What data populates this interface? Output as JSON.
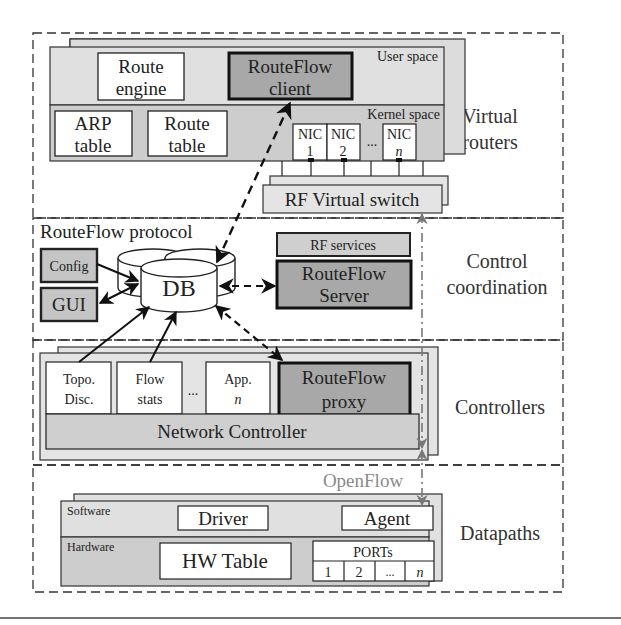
{
  "layers": [
    {
      "id": "virtual-routers",
      "label_line1": "Virtual",
      "label_line2": "routers"
    },
    {
      "id": "control-coordination",
      "label_line1": "Control",
      "label_line2": "coordination"
    },
    {
      "id": "controllers",
      "label": "Controllers"
    },
    {
      "id": "datapaths",
      "label": "Datapaths"
    }
  ],
  "virtual_router": {
    "user_space_label": "User space",
    "kernel_space_label": "Kernel space",
    "route_engine": {
      "line1": "Route",
      "line2": "engine"
    },
    "routeflow_client": {
      "line1": "RouteFlow",
      "line2": "client"
    },
    "arp_table": {
      "line1": "ARP",
      "line2": "table"
    },
    "route_table": {
      "line1": "Route",
      "line2": "table"
    },
    "nics": [
      {
        "line1": "NIC",
        "line2": "1"
      },
      {
        "line1": "NIC",
        "line2": "2"
      },
      {
        "line1": "NIC",
        "line2": "n"
      }
    ],
    "nic_ellipsis": "...",
    "rf_virtual_switch": "RF Virtual switch"
  },
  "control": {
    "protocol_label": "RouteFlow protocol",
    "config": "Config",
    "gui": "GUI",
    "db": "DB",
    "rf_services": "RF services",
    "routeflow_server": {
      "line1": "RouteFlow",
      "line2": "Server"
    }
  },
  "controllers": {
    "apps": [
      {
        "line1": "Topo.",
        "line2": "Disc."
      },
      {
        "line1": "Flow",
        "line2": "stats"
      },
      {
        "line1": "App.",
        "line2": "n"
      }
    ],
    "app_ellipsis": "...",
    "routeflow_proxy": {
      "line1": "RouteFlow",
      "line2": "proxy"
    },
    "network_controller": "Network Controller"
  },
  "datapaths": {
    "openflow_label": "OpenFlow",
    "software_label": "Software",
    "hardware_label": "Hardware",
    "driver": "Driver",
    "agent": "Agent",
    "hw_table": "HW Table",
    "ports_label": "PORTs",
    "ports": [
      "1",
      "2",
      "...",
      "n"
    ]
  },
  "colors": {
    "light_fill": "#e2e2e2",
    "mid_fill": "#cfcfcf",
    "dark_fill": "#a9a9a9",
    "stroke": "#222222",
    "openflow_gray": "#8a8a8a"
  }
}
